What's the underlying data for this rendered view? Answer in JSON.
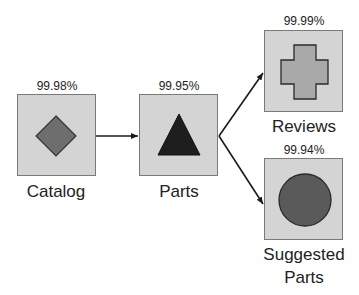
{
  "diagram": {
    "nodes": [
      {
        "id": "catalog",
        "label": "Catalog",
        "availability": "99.98%",
        "shape": "diamond"
      },
      {
        "id": "parts",
        "label": "Parts",
        "availability": "99.95%",
        "shape": "triangle"
      },
      {
        "id": "reviews",
        "label": "Reviews",
        "availability": "99.99%",
        "shape": "cross"
      },
      {
        "id": "suggested",
        "label_line1": "Suggested",
        "label_line2": "Parts",
        "availability": "99.94%",
        "shape": "circle"
      }
    ],
    "edges": [
      {
        "from": "catalog",
        "to": "parts"
      },
      {
        "from": "parts",
        "to": "reviews"
      },
      {
        "from": "parts",
        "to": "suggested"
      }
    ],
    "colors": {
      "box_fill": "#d4d4d4",
      "box_border": "#7a7a7a",
      "diamond_fill": "#6e6e6e",
      "triangle_fill": "#1e1e1e",
      "cross_fill": "#a9a9a9",
      "circle_fill": "#5a5a5a",
      "arrow": "#1a1a1a"
    }
  }
}
